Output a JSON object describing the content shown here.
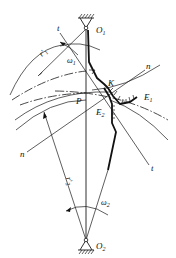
{
  "figure": {
    "labels": {
      "O1": "O",
      "O1_sub": "1",
      "O2": "O",
      "O2_sub": "2",
      "P": "P",
      "K": "K",
      "E1": "E",
      "E1_sub": "1",
      "E2": "E",
      "E2_sub": "2",
      "t_top": "t",
      "t_bottom": "t",
      "n_top": "n",
      "n_bottom": "n",
      "omega1": "ω",
      "omega1_sub": "1",
      "omega2": "ω",
      "omega2_sub": "2",
      "r1": "r'",
      "r1_sub": "1",
      "r2": "r'",
      "r2_sub": "2"
    }
  }
}
